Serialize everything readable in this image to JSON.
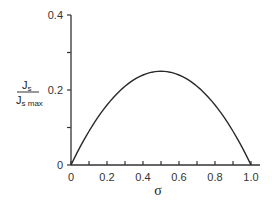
{
  "chart_data": {
    "type": "line",
    "title": "",
    "xlabel": "σ",
    "ylabel": "J_s / J_s_max",
    "ylabel_parts": {
      "numerator": "J",
      "numerator_sub": "s",
      "denominator": "J",
      "denominator_sub": "s max"
    },
    "xlim": [
      0,
      1.0
    ],
    "ylim": [
      0,
      0.4
    ],
    "x_ticks": [
      "0",
      "0.2",
      "0.4",
      "0.6",
      "0.8",
      "1.0"
    ],
    "y_ticks": [
      "0",
      "0.2",
      "0.4"
    ],
    "grid": false,
    "legend": null,
    "series": [
      {
        "name": "J_s/J_s_max",
        "x": [
          0,
          0.1,
          0.2,
          0.3,
          0.4,
          0.5,
          0.6,
          0.7,
          0.8,
          0.9,
          1.0
        ],
        "values": [
          0,
          0.09,
          0.16,
          0.21,
          0.24,
          0.25,
          0.24,
          0.21,
          0.16,
          0.09,
          0
        ]
      }
    ]
  }
}
